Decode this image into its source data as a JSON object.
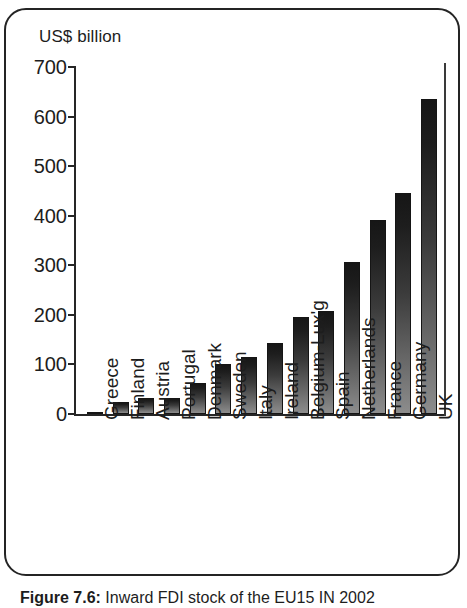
{
  "figure": {
    "caption_label": "Figure 7.6:",
    "caption_text": " Inward FDI stock of the EU15 IN 2002"
  },
  "chart_data": {
    "type": "bar",
    "title": "",
    "subtitle": "",
    "xlabel": "",
    "ylabel": "US$ billion",
    "unit_label": "US$ billion",
    "ylim": [
      0,
      700
    ],
    "yticks": [
      0,
      100,
      200,
      300,
      400,
      500,
      600,
      700
    ],
    "ytick_labels": [
      "0",
      "100",
      "200",
      "300",
      "400",
      "500",
      "600",
      "700"
    ],
    "grid": false,
    "legend": "none",
    "orientation": "vertical",
    "categories": [
      "Greece",
      "Finland",
      "Austria",
      "Portugal",
      "Denmark",
      "Sweden",
      "Italy",
      "Ireland",
      "Belgium-Lux'g",
      "Spain",
      "Netherlands",
      "France",
      "Germany",
      "UK"
    ],
    "values": [
      5,
      25,
      32,
      32,
      63,
      100,
      115,
      143,
      196,
      208,
      306,
      392,
      445,
      635
    ],
    "bar_color_top": "#161616",
    "bar_color_bottom": "#8d8d8d",
    "axis_color": "#262626"
  }
}
